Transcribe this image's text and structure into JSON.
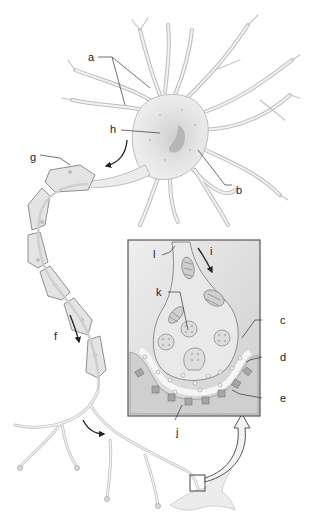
{
  "diagram": {
    "labels": {
      "a": "a",
      "b": "b",
      "c": "c",
      "d": "d",
      "e": "e",
      "f": "f",
      "g": "g",
      "h": "h",
      "i": "i",
      "j": "j",
      "k": "k",
      "l": "l"
    },
    "colors": {
      "cell_fill": "#ececec",
      "cell_stroke": "#9a9a9a",
      "soma_shade": "#d6d6d6",
      "nucleus": "#bdbdbd",
      "inset_bg": "#dcdcdc",
      "inset_border": "#555555",
      "myelin_fill": "#e4e4e4",
      "receptor": "#9e9e9e",
      "arrow": "#222222",
      "label_text": "#222222"
    }
  }
}
